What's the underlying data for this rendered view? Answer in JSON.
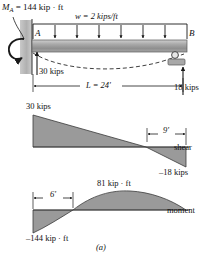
{
  "figure": {
    "caption": "(a)",
    "beam": {
      "moment_label_symbol": "M",
      "moment_label_subscript": "A",
      "moment_label_value": "= 144 kip · ft",
      "distributed_load_label": "w = 2 kips/ft",
      "node_a": "A",
      "node_b": "B",
      "reaction_left": "30 kips",
      "reaction_right": "18 kips",
      "span_label": "L = 24'",
      "n_load_arrows": 6
    },
    "shear_diagram": {
      "title": "shear",
      "peak_positive": "30 kips",
      "peak_negative": "–18 kips",
      "dimension": "9'",
      "values": {
        "left": 30,
        "right": -18,
        "zero_crossing_ft": 15
      }
    },
    "moment_diagram": {
      "title": "moment",
      "max_positive": "81 kip · ft",
      "min_negative": "–144 kip · ft",
      "dimension": "6'",
      "values": {
        "left": -144,
        "max": 81,
        "right": 0,
        "zero_crossing_ft": 6
      }
    },
    "colors": {
      "fill": "#9a9a9a",
      "stroke": "#1a1a1a",
      "beam_light": "#d8d8d8",
      "beam_dark": "#8e8e8e",
      "wall": "#b9b9b9"
    }
  }
}
